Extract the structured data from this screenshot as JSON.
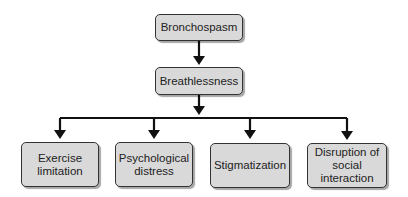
{
  "diagram": {
    "type": "flowchart",
    "nodes": [
      {
        "id": "bronchospasm",
        "label": "Bronchospasm"
      },
      {
        "id": "breathlessness",
        "label": "Breathlessness"
      },
      {
        "id": "exercise",
        "label": "Exercise limitation"
      },
      {
        "id": "psych",
        "label": "Psychological distress"
      },
      {
        "id": "stigma",
        "label": "Stigmatization"
      },
      {
        "id": "disruption",
        "label": "Disruption of social interaction"
      }
    ],
    "edges": [
      {
        "from": "bronchospasm",
        "to": "breathlessness"
      },
      {
        "from": "breathlessness",
        "to": "exercise"
      },
      {
        "from": "breathlessness",
        "to": "psych"
      },
      {
        "from": "breathlessness",
        "to": "stigma"
      },
      {
        "from": "breathlessness",
        "to": "disruption"
      }
    ],
    "colors": {
      "box_fill": "#d9d9d9",
      "stroke": "#111111"
    }
  }
}
